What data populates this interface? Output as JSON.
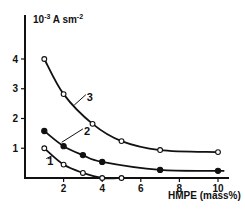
{
  "chart_data": {
    "type": "line",
    "title": "",
    "xlabel": "HMPE (mass%)",
    "ylabel": "10-3 A sm-2",
    "ylabel_parts": {
      "base": "10",
      "exp1": "-3",
      "mid": " A sm",
      "exp2": "-2"
    },
    "xlim": [
      0,
      10.5
    ],
    "ylim": [
      0,
      4.6
    ],
    "x_ticks": [
      2,
      4,
      6,
      8,
      10
    ],
    "y_ticks": [
      1,
      2,
      3,
      4
    ],
    "grid": false,
    "legend": "inline numeric labels",
    "series": [
      {
        "name": "1",
        "marker": "open-circle",
        "x": [
          1,
          2,
          3,
          4,
          5
        ],
        "y": [
          1.0,
          0.45,
          0.17,
          0.0,
          0.0
        ],
        "curve_end_x": 5
      },
      {
        "name": "2",
        "marker": "filled-circle",
        "x": [
          1,
          2,
          3,
          4,
          7,
          10
        ],
        "y": [
          1.58,
          1.07,
          0.77,
          0.54,
          0.27,
          0.24
        ],
        "curve_end_x": 10.2
      },
      {
        "name": "3",
        "marker": "open-circle",
        "x": [
          1,
          2,
          3.5,
          5,
          7,
          10
        ],
        "y": [
          4.0,
          2.82,
          1.82,
          1.24,
          0.94,
          0.87
        ],
        "curve_end_x": 10
      }
    ],
    "series_label_positions": [
      {
        "name": "1",
        "label_x": 1.0,
        "label_y": 0.45,
        "leader_to_x": 1.4,
        "leader_to_y": 0.75
      },
      {
        "name": "2",
        "label_x": 2.9,
        "label_y": 1.45,
        "leader_to_x": 1.9,
        "leader_to_y": 1.2
      },
      {
        "name": "3",
        "label_x": 3.05,
        "label_y": 2.6,
        "leader_to_x": 2.55,
        "leader_to_y": 2.45
      }
    ],
    "colors": {
      "line": "#111111",
      "axis": "#111111",
      "background": "#ffffff"
    }
  }
}
